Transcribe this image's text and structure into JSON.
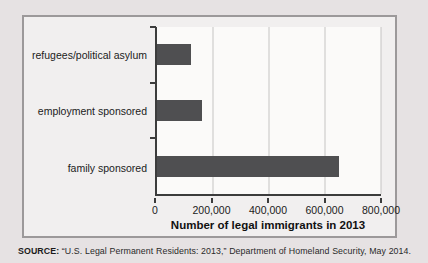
{
  "chart_data": {
    "type": "bar",
    "orientation": "horizontal",
    "categories": [
      "refugees/political asylum",
      "employment sponsored",
      "family sponsored"
    ],
    "values": [
      120000,
      160000,
      650000
    ],
    "xlabel": "Number of legal immigrants in 2013",
    "ylabel": "",
    "xlim": [
      0,
      800000
    ],
    "x_ticks": [
      0,
      200000,
      400000,
      600000,
      800000
    ],
    "x_tick_labels": [
      "0",
      "200,000",
      "400,000",
      "600,000",
      "800,000"
    ],
    "grid": "vertical",
    "legend": "none",
    "bar_color": "#4f4f51",
    "gridline_color": "#c6c4c4",
    "plot_background": "#fbfaf9"
  },
  "source_note": {
    "label": "SOURCE:",
    "text": " “U.S. Legal Permanent Residents: 2013,” Department of Homeland Security, May 2014."
  }
}
